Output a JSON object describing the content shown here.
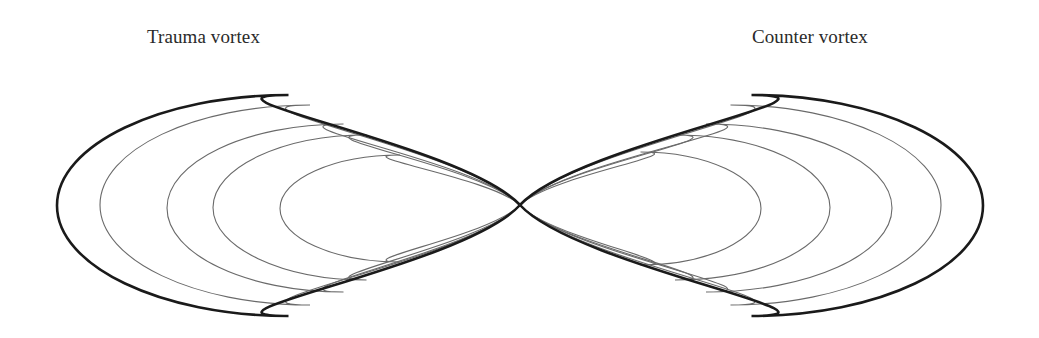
{
  "diagram": {
    "title_left": "Trauma vortex",
    "title_right": "Counter vortex",
    "crossing_point": {
      "x": 520,
      "y": 205
    },
    "colors": {
      "background": "#ffffff",
      "outer_loop": "#1a1a1a",
      "inner_loops": "#6a6a6a",
      "text": "#2a2a2a"
    },
    "left_vortex": {
      "name": "Trauma vortex",
      "outer_loop": {
        "extreme_x": 57,
        "top_y": 95,
        "bottom_y": 316
      },
      "inner_loops": [
        {
          "extreme_x": 100,
          "top_y": 105,
          "bottom_y": 305
        },
        {
          "extreme_x": 167,
          "top_y": 124,
          "bottom_y": 292
        },
        {
          "extreme_x": 213,
          "top_y": 135,
          "bottom_y": 280
        },
        {
          "extreme_x": 280,
          "top_y": 155,
          "bottom_y": 262
        }
      ]
    },
    "right_vortex": {
      "name": "Counter vortex",
      "outer_loop": {
        "extreme_x": 983,
        "top_y": 95,
        "bottom_y": 316
      },
      "inner_loops": [
        {
          "extreme_x": 941,
          "top_y": 105,
          "bottom_y": 305
        },
        {
          "extreme_x": 892,
          "top_y": 124,
          "bottom_y": 292
        },
        {
          "extreme_x": 830,
          "top_y": 135,
          "bottom_y": 280
        },
        {
          "extreme_x": 761,
          "top_y": 152,
          "bottom_y": 265
        }
      ]
    }
  }
}
